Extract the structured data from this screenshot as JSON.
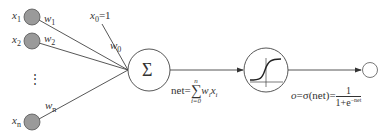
{
  "diagram": {
    "title": "",
    "inputs": [
      {
        "label": "x",
        "sub": "1",
        "weight": "w",
        "weight_sub": "1"
      },
      {
        "label": "x",
        "sub": "2",
        "weight": "w",
        "weight_sub": "2"
      },
      {
        "label": "x",
        "sub": "n",
        "weight": "w",
        "weight_sub": "n"
      }
    ],
    "ellipsis": "⋮",
    "bias": {
      "label": "x",
      "sub": "0",
      "value": "=1",
      "weight": "w",
      "weight_sub": "0"
    },
    "summation": {
      "symbol": "Σ"
    },
    "net_formula": {
      "lhs": "net=",
      "sum_top": "n",
      "sum_bottom": "i=0",
      "sum_symbol": "∑",
      "term_w": "w",
      "term_w_sub": "i",
      "term_x": "x",
      "term_x_sub": "i"
    },
    "activation": {
      "name": "sigmoid"
    },
    "output_formula": {
      "o": "o",
      "eq1": "=σ(net)=",
      "numerator": "1",
      "denominator_base": "1+e",
      "denominator_exp": "−net"
    },
    "colors": {
      "input_fill": "#9a9a9a",
      "stroke": "#444444",
      "background": "#ffffff"
    }
  }
}
